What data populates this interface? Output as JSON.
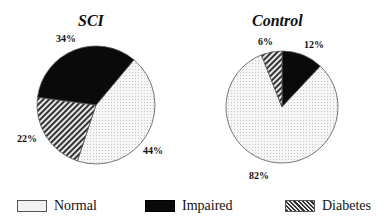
{
  "chart_data": [
    {
      "type": "pie",
      "title": "SCI",
      "categories": [
        "Normal",
        "Impaired",
        "Diabetes"
      ],
      "values": [
        44,
        34,
        22
      ],
      "labels": [
        "44%",
        "34%",
        "22%"
      ]
    },
    {
      "type": "pie",
      "title": "Control",
      "categories": [
        "Normal",
        "Impaired",
        "Diabetes"
      ],
      "values": [
        82,
        12,
        6
      ],
      "labels": [
        "82%",
        "12%",
        "6%"
      ]
    }
  ],
  "charts": {
    "sci": {
      "title": "SCI",
      "normal": "44%",
      "impaired": "34%",
      "diabetes": "22%"
    },
    "control": {
      "title": "Control",
      "normal": "82%",
      "impaired": "12%",
      "diabetes": "6%"
    }
  },
  "legend": {
    "position": "bottom",
    "items": [
      {
        "label": "Normal",
        "pattern": "dotted-light"
      },
      {
        "label": "Impaired",
        "pattern": "solid-black"
      },
      {
        "label": "Diabetes",
        "pattern": "diagonal-hatch"
      }
    ]
  },
  "colors": {
    "normal": "#f0f0f0",
    "impaired": "#0a0a0a",
    "diabetes_line": "#333333",
    "outline": "#555555"
  }
}
